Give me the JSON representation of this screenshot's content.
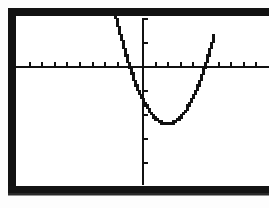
{
  "screen": {
    "device_label": "graphing-calculator-screen",
    "background_color": "#ffffff",
    "frame_color": "#121212",
    "ink_color": "#111111"
  },
  "chart_data": {
    "type": "line",
    "title": "",
    "subtitle": "",
    "xlabel": "",
    "ylabel": "",
    "curve_label": "parabola",
    "equation": "y = a(x - h)^2 + k",
    "grid": false,
    "legend": false,
    "axes": {
      "x_axis_visible": true,
      "y_axis_visible": true,
      "x_axis_pixel_y": 50,
      "y_axis_pixel_x": 126,
      "x_tick_spacing_px": 12.6,
      "y_tick_spacing_px": 24,
      "x_tick_count": 20,
      "y_tick_count": 6,
      "xlim": [
        -10,
        10
      ],
      "ylim": [
        -10,
        10
      ]
    },
    "features": {
      "vertex": [
        1.5,
        -5.5
      ],
      "x_intercepts": [
        -1.0,
        4.0
      ],
      "y_intercept": -4.0,
      "opens": "up"
    },
    "x": [
      -2.6,
      -2.4,
      -2.2,
      -2.0,
      -1.8,
      -1.6,
      -1.4,
      -1.2,
      -1.0,
      -0.8,
      -0.6,
      -0.4,
      -0.2,
      0.0,
      0.2,
      0.4,
      0.6,
      0.8,
      1.0,
      1.2,
      1.4,
      1.6,
      1.8,
      2.0,
      2.2,
      2.4,
      2.6,
      2.8,
      3.0,
      3.2,
      3.4,
      3.6,
      3.8,
      4.0,
      4.2,
      4.4,
      4.6,
      4.8,
      5.0,
      5.2,
      5.4,
      5.6
    ],
    "y": [
      7.22,
      6.12,
      5.07,
      4.07,
      3.12,
      2.22,
      1.37,
      0.57,
      -0.18,
      -0.88,
      -1.53,
      -2.13,
      -2.68,
      -3.18,
      -3.63,
      -4.03,
      -4.38,
      -4.68,
      -4.93,
      -5.13,
      -5.28,
      -5.38,
      -5.43,
      -5.43,
      -5.38,
      -5.28,
      -5.13,
      -4.93,
      -4.68,
      -4.38,
      -4.03,
      -3.63,
      -3.18,
      -2.68,
      -2.13,
      -1.53,
      -0.88,
      -0.18,
      0.57,
      1.37,
      2.22,
      3.12
    ]
  }
}
